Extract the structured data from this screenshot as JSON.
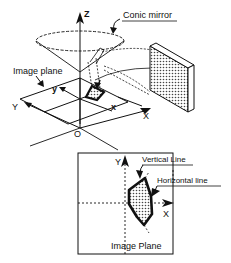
{
  "diagram": {
    "top": {
      "axis_labels": {
        "z": "Z",
        "x_world": "X",
        "y_world": "Y",
        "x_image": "x",
        "y_image": "y",
        "origin": "O"
      },
      "callouts": {
        "conic_mirror": "Conic mirror",
        "image_plane": "Image  plane"
      }
    },
    "bottom": {
      "axis_labels": {
        "x": "X",
        "y": "Y"
      },
      "callouts": {
        "vertical_line": "Vertical Line",
        "horizontal_line": "Horizontal line"
      },
      "caption": "Image Plane"
    },
    "colors": {
      "ink": "#111111",
      "background": "#ffffff",
      "fill_stipple": "#9a9a9a"
    }
  }
}
